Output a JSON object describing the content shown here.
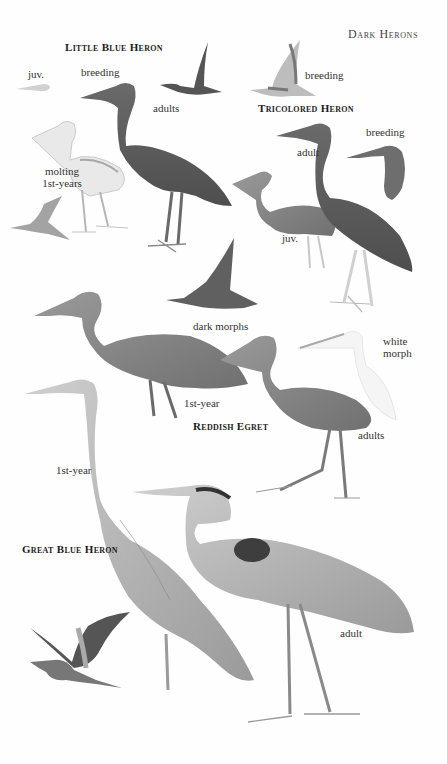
{
  "page": {
    "header": "Dark Herons",
    "background": "#ffffff"
  },
  "species": [
    {
      "name": "Little Blue Heron",
      "labels": [
        "juv.",
        "breeding",
        "adults",
        "molting 1st-years"
      ]
    },
    {
      "name": "Tricolored Heron",
      "labels": [
        "breeding",
        "adult",
        "breeding",
        "juv."
      ]
    },
    {
      "name": "Reddish Egret",
      "labels": [
        "dark morphs",
        "white morph",
        "1st-year",
        "adults"
      ]
    },
    {
      "name": "Great Blue Heron",
      "labels": [
        "1st-year",
        "adult"
      ]
    }
  ],
  "labels": {
    "lbh_juv": "juv.",
    "lbh_breeding": "breeding",
    "lbh_adults": "adults",
    "lbh_molting_1": "molting",
    "lbh_molting_2": "1st-years",
    "trh_flight_breeding": "breeding",
    "trh_adult": "adult",
    "trh_breeding": "breeding",
    "trh_juv": "juv.",
    "re_dark_morphs": "dark morphs",
    "re_white_1": "white",
    "re_white_2": "morph",
    "re_1st_year": "1st-year",
    "re_adults": "adults",
    "gbh_1st_year": "1st-year",
    "gbh_adult": "adult"
  },
  "colors": {
    "ink": "#2a2a2a",
    "bird_dark": "#5e5e5e",
    "bird_mid": "#8a8a8a",
    "bird_light": "#b8b8b8",
    "bird_pale": "#e4e4e4"
  }
}
